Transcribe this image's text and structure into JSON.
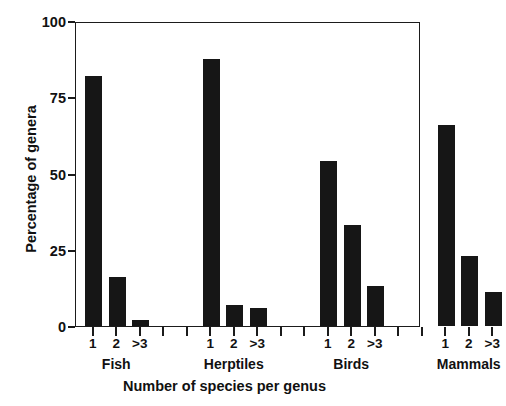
{
  "chart_data": {
    "type": "bar",
    "title": "",
    "xlabel": "Number of species per genus",
    "ylabel": "Percentage of genera",
    "ylim": [
      0,
      100
    ],
    "yticks": [
      0,
      25,
      50,
      75,
      100
    ],
    "ytick_labels": [
      "0",
      "25",
      "50",
      "75",
      "100"
    ],
    "categories": [
      "1",
      "2",
      ">3"
    ],
    "groups": [
      "Fish",
      "Herptiles",
      "Birds",
      "Mammals"
    ],
    "grid": false,
    "legend": "none",
    "bar_color": "#161616",
    "axis_color": "#1b1b1b",
    "series": [
      {
        "name": "Fish",
        "categories": [
          "1",
          "2",
          ">3"
        ],
        "values": [
          82,
          16,
          2
        ]
      },
      {
        "name": "Herptiles",
        "categories": [
          "1",
          "2",
          ">3"
        ],
        "values": [
          87.5,
          7,
          6
        ]
      },
      {
        "name": "Birds",
        "categories": [
          "1",
          "2",
          ">3"
        ],
        "values": [
          54,
          33,
          13
        ]
      },
      {
        "name": "Mammals",
        "categories": [
          "1",
          "2",
          ">3"
        ],
        "values": [
          66,
          23,
          11
        ]
      }
    ]
  }
}
